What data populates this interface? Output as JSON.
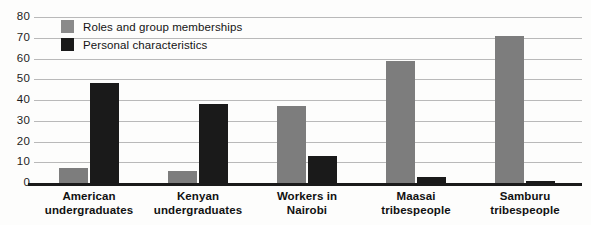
{
  "chart_data": {
    "type": "bar",
    "title": "",
    "subtitle": "",
    "xlabel": "",
    "ylabel": "",
    "ylim": [
      0,
      80
    ],
    "ytick_step": 10,
    "yticks": [
      80,
      70,
      60,
      50,
      40,
      30,
      20,
      10,
      0
    ],
    "grid": true,
    "legend_position": "top-left",
    "categories": [
      "American undergraduates",
      "Kenyan undergraduates",
      "Workers in Nairobi",
      "Maasai tribespeople",
      "Samburu tribespeople"
    ],
    "category_lines": [
      [
        "American",
        "undergraduates"
      ],
      [
        "Kenyan",
        "undergraduates"
      ],
      [
        "Workers in",
        "Nairobi"
      ],
      [
        "Maasai",
        "tribespeople"
      ],
      [
        "Samburu",
        "tribespeople"
      ]
    ],
    "series": [
      {
        "name": "Roles and group memberships",
        "color": "#7d7d7d",
        "values": [
          7,
          6,
          37,
          59,
          71
        ]
      },
      {
        "name": "Personal characteristics",
        "color": "#1a1a1a",
        "values": [
          48,
          38,
          13,
          3,
          1
        ]
      }
    ]
  },
  "legend": {
    "items": [
      {
        "label": "Roles and group memberships",
        "swatch": "roles"
      },
      {
        "label": "Personal characteristics",
        "swatch": "personal"
      }
    ]
  },
  "colors": {
    "roles": "#7d7d7d",
    "personal": "#1a1a1a",
    "gridline": "#b9b9b9",
    "axis": "#1a1a1a",
    "background": "#fdfdfc"
  }
}
